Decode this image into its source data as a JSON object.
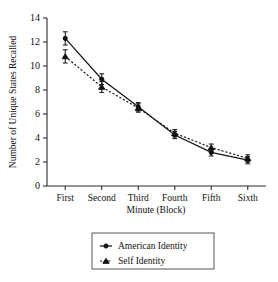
{
  "chart_data": {
    "type": "line",
    "title": "",
    "xlabel": "Minute (Block)",
    "ylabel": "Number of Unique States Recalled",
    "categories": [
      "First",
      "Second",
      "Third",
      "Fourth",
      "Fifth",
      "Sixth"
    ],
    "ylim": [
      0,
      14
    ],
    "ytick_labels": [
      "0",
      "2",
      "4",
      "6",
      "8",
      "10",
      "12",
      "14"
    ],
    "ytick_values": [
      0,
      2,
      4,
      6,
      8,
      10,
      12,
      14
    ],
    "grid": false,
    "legend_position": "below-axis",
    "series": [
      {
        "name": "American Identity",
        "values": [
          12.3,
          8.9,
          6.6,
          4.25,
          2.8,
          2.15
        ],
        "errors": [
          0.55,
          0.45,
          0.35,
          0.3,
          0.3,
          0.3
        ],
        "line_style": "solid",
        "marker": "circle",
        "color": "#161616"
      },
      {
        "name": "Self Identity",
        "values": [
          10.8,
          8.25,
          6.5,
          4.4,
          3.2,
          2.3
        ],
        "errors": [
          0.55,
          0.45,
          0.35,
          0.3,
          0.3,
          0.3
        ],
        "line_style": "dashed",
        "marker": "triangle",
        "color": "#161616"
      }
    ]
  },
  "legend": {
    "items": [
      {
        "label": "American Identity"
      },
      {
        "label": "Self Identity"
      }
    ]
  },
  "axes": {
    "y_title": "Number of Unique States Recalled",
    "x_title": "Minute (Block)"
  }
}
